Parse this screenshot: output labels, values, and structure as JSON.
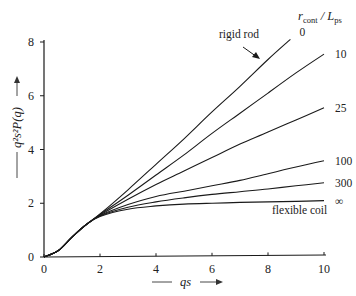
{
  "chart_data": {
    "type": "line",
    "title": "",
    "xlabel": "qs",
    "ylabel": "q²s²P(q)",
    "xlim": [
      0,
      10
    ],
    "ylim": [
      0,
      8
    ],
    "xticks": [
      0,
      2,
      4,
      6,
      8,
      10
    ],
    "yticks": [
      0,
      2,
      4,
      6,
      8
    ],
    "grid": false,
    "legend_title": {
      "main": "r",
      "main_sub": "cont",
      "sep": " / L",
      "sep_sub": "ps"
    },
    "annotations": {
      "rigid_rod": "rigid rod",
      "flexible_coil": "flexible coil"
    },
    "x": [
      0,
      0.5,
      1,
      1.5,
      2,
      3,
      4,
      5,
      6,
      7,
      8,
      8.8,
      9,
      10
    ],
    "series": [
      {
        "name": "0",
        "label": "0",
        "values": [
          0,
          0.23,
          0.74,
          1.2,
          1.6,
          2.5,
          3.45,
          4.4,
          5.4,
          6.35,
          7.35,
          8.1,
          null,
          null
        ]
      },
      {
        "name": "10",
        "label": "10",
        "values": [
          0,
          0.23,
          0.74,
          1.2,
          1.58,
          2.3,
          3.05,
          3.8,
          4.6,
          5.35,
          6.1,
          null,
          6.85,
          7.55
        ]
      },
      {
        "name": "25",
        "label": "25",
        "values": [
          0,
          0.23,
          0.74,
          1.2,
          1.56,
          2.15,
          2.7,
          3.2,
          3.7,
          4.2,
          4.65,
          null,
          5.1,
          5.55
        ]
      },
      {
        "name": "100",
        "label": "100",
        "values": [
          0,
          0.23,
          0.74,
          1.2,
          1.54,
          1.95,
          2.25,
          2.45,
          2.65,
          2.85,
          3.1,
          null,
          3.35,
          3.58
        ]
      },
      {
        "name": "300",
        "label": "300",
        "values": [
          0,
          0.23,
          0.74,
          1.2,
          1.53,
          1.85,
          2.05,
          2.2,
          2.33,
          2.43,
          2.53,
          null,
          2.65,
          2.76
        ]
      },
      {
        "name": "∞",
        "label": "∞",
        "values": [
          0,
          0.23,
          0.74,
          1.2,
          1.51,
          1.78,
          1.9,
          1.97,
          2.0,
          2.03,
          2.05,
          null,
          2.07,
          2.1
        ]
      }
    ]
  }
}
